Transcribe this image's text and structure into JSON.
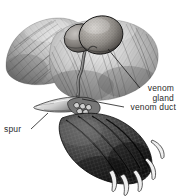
{
  "figure": {
    "background_color": "#ffffff",
    "ink_color": "#2b2b2b",
    "width": 180,
    "height": 196
  },
  "labels": {
    "venom_gland": {
      "line1": "venom",
      "line2": "gland"
    },
    "venom_duct": "venom duct",
    "spur": "spur"
  },
  "parts": {
    "fur_mass": "furred-leg",
    "gland_left_lobe": "venom-gland-left-lobe",
    "gland_right_lobe": "venom-gland-right-lobe",
    "duct": "venom-duct-tube",
    "spur": "spur-point",
    "webbed_foot": "webbed-foot",
    "claws": "claws"
  }
}
